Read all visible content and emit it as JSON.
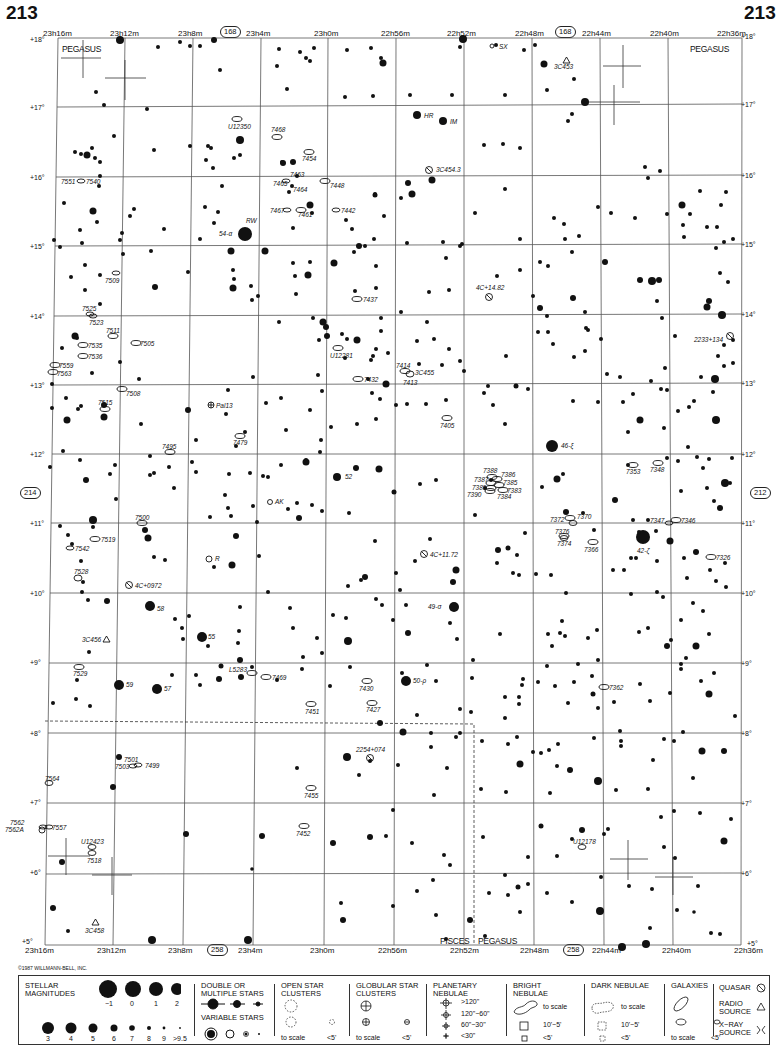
{
  "chart_number": "213",
  "adjacent_charts": {
    "top": "168",
    "bottom": "258",
    "left": "214",
    "right": "212"
  },
  "ra_labels": [
    "23h16m",
    "23h12m",
    "23h8m",
    "23h4m",
    "23h0m",
    "22h56m",
    "22h52m",
    "22h48m",
    "22h44m",
    "22h40m",
    "22h36m"
  ],
  "dec_labels": [
    "+18°",
    "+17°",
    "+16°",
    "+15°",
    "+14°",
    "+13°",
    "+12°",
    "+11°",
    "+10°",
    "+9°",
    "+8°",
    "+7°",
    "+6°",
    "+5°"
  ],
  "constellations": {
    "top_left": "PEGASUS",
    "top_right": "PEGASUS",
    "bottom_left_boundary": "PISCES",
    "bottom_right_boundary": "PEGASUS"
  },
  "copyright": "©1987 WILLMANN-BELL, INC.",
  "objects": {
    "galaxies": [
      "U12350",
      "7468",
      "7454",
      "7463",
      "7465",
      "7464",
      "7448",
      "7467",
      "7461",
      "7442",
      "7551",
      "7540",
      "7509",
      "7525",
      "7523",
      "7511",
      "7505",
      "7535",
      "7536",
      "7559",
      "7563",
      "7508",
      "7515",
      "7479",
      "7495",
      "7437",
      "U12281",
      "7432",
      "7414",
      "7413",
      "7405",
      "7388",
      "7386",
      "7387",
      "7385",
      "7389",
      "7383",
      "7390",
      "7384",
      "7353",
      "7348",
      "7372",
      "7370",
      "7376",
      "7374",
      "7366",
      "7347",
      "7346",
      "7326",
      "7500",
      "7519",
      "7542",
      "7528",
      "7529",
      "L5283",
      "7469",
      "7430",
      "7451",
      "7427",
      "7362",
      "7501",
      "7503",
      "7499",
      "7564",
      "7455",
      "7452",
      "7562",
      "7562A",
      "7557",
      "U12423",
      "7518",
      "U12178"
    ],
    "quasars": [
      "3C454.3",
      "4C+14.82",
      "2233+134",
      "3C455",
      "4C+11.72",
      "4C+0972",
      "2254+074"
    ],
    "radio_sources": [
      "3C453",
      "3C456",
      "3C458"
    ],
    "globular_clusters": [
      "Pal13"
    ],
    "variable_stars": [
      "SX",
      "RW",
      "HR",
      "IM",
      "AK",
      "R"
    ],
    "named_stars": [
      "54-α",
      "46-ξ",
      "52",
      "42-ζ",
      "58",
      "49-σ",
      "55",
      "59",
      "57",
      "50-ρ"
    ]
  },
  "legend": {
    "stellar_magnitudes": {
      "title": "STELLAR MAGNITUDES",
      "row1": [
        "−1",
        "0",
        "1",
        "2"
      ],
      "row2": [
        "3",
        "4",
        "5",
        "6",
        "7",
        "8",
        "9",
        ">9.5"
      ]
    },
    "double_stars": {
      "title": "DOUBLE OR MULTIPLE STARS"
    },
    "variable_stars": {
      "title": "VARIABLE STARS"
    },
    "open_clusters": {
      "title": "OPEN STAR CLUSTERS",
      "to_scale": "to scale",
      "small": "<5'"
    },
    "globular_clusters": {
      "title": "GLOBULAR STAR CLUSTERS",
      "to_scale": "to scale",
      "small": "<5'"
    },
    "planetary_nebulae": {
      "title": "PLANETARY NEBULAE",
      "sizes": [
        ">120\"",
        "120\"−60\"",
        "60\"−30\"",
        "<30\""
      ]
    },
    "bright_nebulae": {
      "title": "BRIGHT NEBULAE",
      "to_scale": "to scale",
      "mid": "10'−5'",
      "small": "<5'"
    },
    "dark_nebulae": {
      "title": "DARK NEBULAE",
      "to_scale": "to scale",
      "mid": "10'−5'",
      "small": "<5'"
    },
    "galaxies": {
      "title": "GALAXIES",
      "to_scale": "to scale",
      "small": "<5'"
    },
    "quasar": {
      "title": "QUASAR"
    },
    "radio_source": {
      "title": "RADIO SOURCE"
    },
    "xray_source": {
      "title": "X−RAY SOURCE"
    }
  }
}
